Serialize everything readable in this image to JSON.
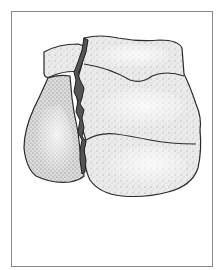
{
  "figure": {
    "style": "stippled pen-and-ink",
    "colors": {
      "frame": "#8a8a8a",
      "bone_fill": "#ececec",
      "bone_shadow": "#c8c8c8",
      "outline": "#2a2a2a",
      "fracture_gap": "#555555",
      "background": "#ffffff"
    }
  }
}
